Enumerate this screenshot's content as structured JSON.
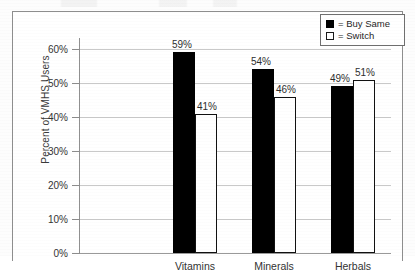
{
  "chart_data": {
    "type": "bar",
    "title": "",
    "subtitle": "",
    "xlabel": "",
    "ylabel": "Percent of VMHS Users",
    "ylim": [
      0,
      65
    ],
    "ytick_values": [
      0,
      10,
      20,
      30,
      40,
      50,
      60
    ],
    "ytick_labels": [
      "0%",
      "10%",
      "20%",
      "30%",
      "40%",
      "50%",
      "60%"
    ],
    "grid": true,
    "grid_axis": "y",
    "legend_position": "top-right",
    "categories": [
      "Vitamins",
      "Minerals",
      "Herbals"
    ],
    "series": [
      {
        "name": "Buy Same",
        "swatch": "dark",
        "color": "#000000",
        "values": [
          59,
          54,
          49
        ],
        "value_labels": [
          "59%",
          "54%",
          "49%"
        ]
      },
      {
        "name": "Switch",
        "swatch": "light",
        "color": "#ffffff",
        "values": [
          41,
          46,
          51
        ],
        "value_labels": [
          "41%",
          "46%",
          "51%"
        ]
      }
    ]
  },
  "legend": {
    "entries": [
      {
        "equals": "= Buy Same",
        "swatch": "dark"
      },
      {
        "equals": "= Switch",
        "swatch": "light"
      }
    ]
  },
  "colors": {
    "buy_same": "#000000",
    "switch": "#ffffff",
    "gridline": "#c9c9c9",
    "axis": "#909090",
    "frame": "#8e8e8e",
    "text": "#2b2b2b",
    "page_background": "#fdfdfd"
  }
}
